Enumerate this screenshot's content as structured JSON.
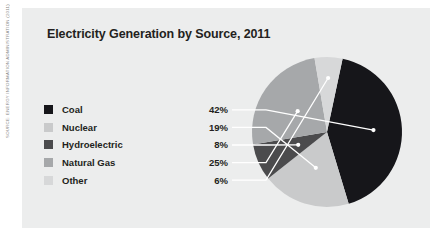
{
  "figure": {
    "source_credit": "SOURCE: ENERGY INFORMATION ADMINISTRATION (2011)",
    "panel_color": "#eceded",
    "background_color": "#ffffff"
  },
  "chart_data": {
    "type": "pie",
    "title": "Electricity Generation by Source, 2011",
    "xlabel": "",
    "ylabel": "",
    "legend_position": "left",
    "grid": false,
    "categories": [
      "Coal",
      "Nuclear",
      "Hydroelectric",
      "Natural Gas",
      "Other"
    ],
    "values": [
      42,
      19,
      8,
      25,
      6
    ],
    "value_labels": [
      "42%",
      "19%",
      "8%",
      "25%",
      "6%"
    ],
    "unit": "%",
    "colors": [
      "#16161a",
      "#c9cacb",
      "#4b4b4d",
      "#a6a8aa",
      "#d7d8d9"
    ],
    "slices": [
      {
        "label": "Coal",
        "value": 42,
        "value_label": "42%",
        "color": "#16161a"
      },
      {
        "label": "Nuclear",
        "value": 19,
        "value_label": "19%",
        "color": "#c9cacb"
      },
      {
        "label": "Hydroelectric",
        "value": 8,
        "value_label": "8%",
        "color": "#4b4b4d"
      },
      {
        "label": "Natural Gas",
        "value": 25,
        "value_label": "25%",
        "color": "#a6a8aa"
      },
      {
        "label": "Other",
        "value": 6,
        "value_label": "6%",
        "color": "#d7d8d9"
      }
    ]
  }
}
